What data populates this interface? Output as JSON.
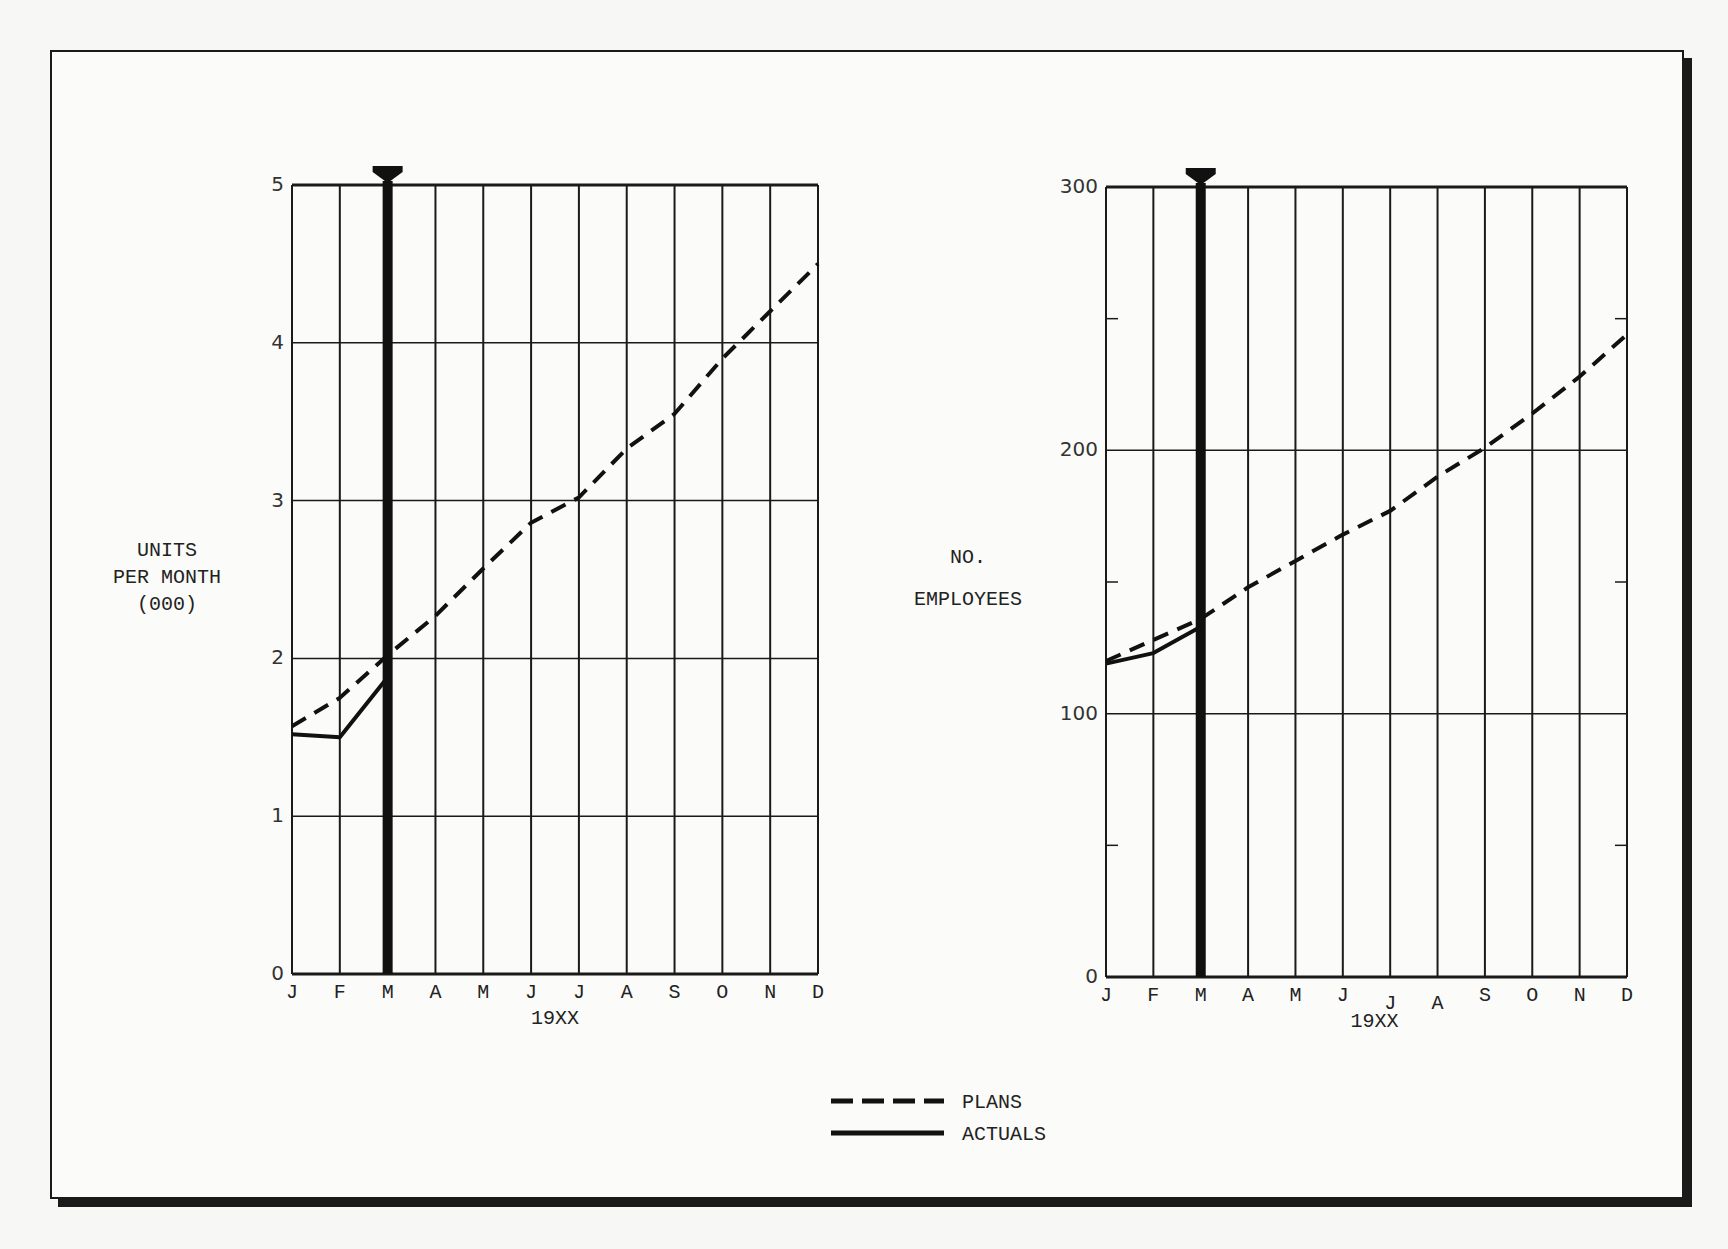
{
  "legend": {
    "items": [
      {
        "label": "PLANS",
        "style": "dashed"
      },
      {
        "label": "ACTUALS",
        "style": "solid"
      }
    ]
  },
  "chart_data": [
    {
      "type": "line",
      "title": "",
      "xlabel": "19XX",
      "ylabel": "UNITS PER MONTH (000)",
      "ylabel_lines": [
        "UNITS",
        "PER MONTH",
        "(000)"
      ],
      "categories": [
        "J",
        "F",
        "M",
        "A",
        "M",
        "J",
        "J",
        "A",
        "S",
        "O",
        "N",
        "D"
      ],
      "yticks": [
        "0",
        "1",
        "2",
        "3",
        "4",
        "5"
      ],
      "ylim": [
        0,
        5
      ],
      "grid": true,
      "current_month_marker": "M",
      "series": [
        {
          "name": "PLANS",
          "style": "dashed",
          "values": [
            1.57,
            1.75,
            2.02,
            2.27,
            2.57,
            2.86,
            3.02,
            3.33,
            3.55,
            3.9,
            4.2,
            4.5
          ]
        },
        {
          "name": "ACTUALS",
          "style": "solid",
          "values": [
            1.52,
            1.5,
            1.88,
            null,
            null,
            null,
            null,
            null,
            null,
            null,
            null,
            null
          ]
        }
      ]
    },
    {
      "type": "line",
      "title": "",
      "xlabel": "19XX",
      "ylabel": "NO. EMPLOYEES",
      "ylabel_lines": [
        "NO.",
        "EMPLOYEES"
      ],
      "categories": [
        "J",
        "F",
        "M",
        "A",
        "M",
        "J",
        "J",
        "A",
        "S",
        "O",
        "N",
        "D"
      ],
      "yticks": [
        "0",
        "100",
        "200",
        "300"
      ],
      "minor_yticks": [
        50,
        150,
        250
      ],
      "ylim": [
        0,
        300
      ],
      "grid": true,
      "current_month_marker": "M",
      "series": [
        {
          "name": "PLANS",
          "style": "dashed",
          "values": [
            120,
            128,
            136,
            148,
            158,
            168,
            177,
            190,
            201,
            214,
            228,
            244
          ]
        },
        {
          "name": "ACTUALS",
          "style": "solid",
          "values": [
            119,
            123,
            133,
            null,
            null,
            null,
            null,
            null,
            null,
            null,
            null,
            null
          ]
        }
      ]
    }
  ]
}
